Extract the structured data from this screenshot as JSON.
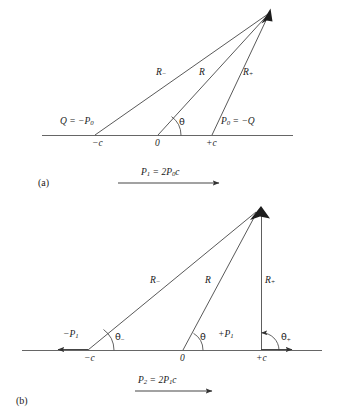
{
  "figure": {
    "type": "diagram",
    "stroke_color": "#3b3b3b",
    "axis_color": "#555555",
    "text_color": "#1a1a1a",
    "background": "#ffffff"
  },
  "panels": [
    {
      "tag": "(a)",
      "axis": {
        "tick_labels": [
          "−c",
          "0",
          "+c"
        ]
      },
      "charge_labels": [
        {
          "name": "left-charge",
          "text": "Q = −P",
          "sub": "0"
        },
        {
          "name": "right-charge",
          "text": "P",
          "sub": "0",
          "tail": " = −Q"
        }
      ],
      "distance_labels": [
        {
          "name": "R-minus",
          "text": "R",
          "sub": "−"
        },
        {
          "name": "R-center",
          "text": "R",
          "sub": ""
        },
        {
          "name": "R-plus",
          "text": "R",
          "sub": "+"
        }
      ],
      "angle_labels": [
        {
          "name": "theta-center",
          "text": "θ",
          "sub": ""
        }
      ],
      "moment": {
        "name": "dipole-moment",
        "lead": "P",
        "lead_sub": "1",
        "rest": " = 2P",
        "rest_sub": "0",
        "tail": "c"
      }
    },
    {
      "tag": "(b)",
      "axis": {
        "tick_labels": [
          "−c",
          "0",
          "+c"
        ]
      },
      "charge_labels": [
        {
          "name": "left-charge",
          "text": "−P",
          "sub": "1"
        },
        {
          "name": "right-charge",
          "text": "+P",
          "sub": "1"
        }
      ],
      "distance_labels": [
        {
          "name": "R-minus",
          "text": "R",
          "sub": "−"
        },
        {
          "name": "R-center",
          "text": "R",
          "sub": ""
        },
        {
          "name": "R-plus",
          "text": "R",
          "sub": "+"
        }
      ],
      "angle_labels": [
        {
          "name": "theta-minus",
          "text": "θ",
          "sub": "−"
        },
        {
          "name": "theta-center",
          "text": "θ",
          "sub": ""
        },
        {
          "name": "theta-plus",
          "text": "θ",
          "sub": "+"
        }
      ],
      "moment": {
        "name": "quadrupole-moment",
        "lead": "P",
        "lead_sub": "2",
        "rest": " = 2P",
        "rest_sub": "1",
        "tail": "c"
      }
    }
  ],
  "text": {
    "a_tag": "(a)",
    "b_tag": "(b)",
    "a_tick_minus_c": "−c",
    "a_tick_zero": "0",
    "a_tick_plus_c": "+c",
    "b_tick_minus_c": "−c",
    "b_tick_zero": "0",
    "b_tick_plus_c": "+c",
    "a_Q_eq": "Q = −P",
    "a_Q_sub": "0",
    "a_P0_lead": "P",
    "a_P0_sub": "0",
    "a_P0_tail": " = −Q",
    "R_letter": "R",
    "sub_minus": "−",
    "sub_plus": "+",
    "theta": "θ",
    "a_moment_lead": "P",
    "a_moment_lead_sub": "1",
    "a_moment_mid": " = 2P",
    "a_moment_mid_sub": "0",
    "a_moment_tail": "c",
    "b_left_lead": "−P",
    "b_left_sub": "1",
    "b_right_lead": "+P",
    "b_right_sub": "1",
    "b_moment_lead": "P",
    "b_moment_lead_sub": "2",
    "b_moment_mid": " = 2P",
    "b_moment_mid_sub": "1",
    "b_moment_tail": "c"
  }
}
